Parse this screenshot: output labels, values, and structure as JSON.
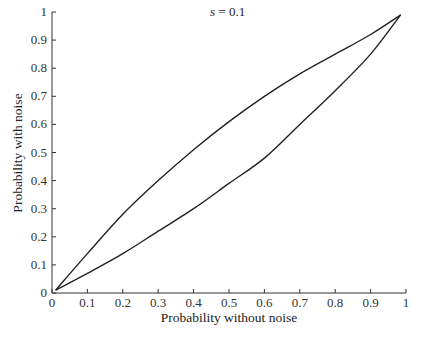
{
  "chart_data": {
    "type": "line",
    "title": "",
    "annotation": "s = 0.1",
    "annotation_var": "s",
    "annotation_rest": " = 0.1",
    "xlabel": "Probability without noise",
    "ylabel": "Probability with noise",
    "xlim": [
      0,
      1
    ],
    "ylim": [
      0,
      1
    ],
    "grid": false,
    "legend": null,
    "x_ticks": [
      "0",
      "0.1",
      "0.2",
      "0.3",
      "0.4",
      "0.5",
      "0.6",
      "0.7",
      "0.8",
      "0.9",
      "1"
    ],
    "y_ticks": [
      "0",
      "0.1",
      "0.2",
      "0.3",
      "0.4",
      "0.5",
      "0.6",
      "0.7",
      "0.8",
      "0.9",
      "1"
    ],
    "x": [
      0.01,
      0.1,
      0.2,
      0.3,
      0.4,
      0.5,
      0.6,
      0.7,
      0.8,
      0.9,
      0.985
    ],
    "series": [
      {
        "name": "upper curve",
        "values": [
          0.01,
          0.14,
          0.28,
          0.4,
          0.51,
          0.61,
          0.7,
          0.78,
          0.85,
          0.92,
          0.99
        ]
      },
      {
        "name": "lower curve",
        "values": [
          0.01,
          0.07,
          0.14,
          0.22,
          0.3,
          0.39,
          0.48,
          0.6,
          0.72,
          0.85,
          0.99
        ]
      }
    ]
  }
}
